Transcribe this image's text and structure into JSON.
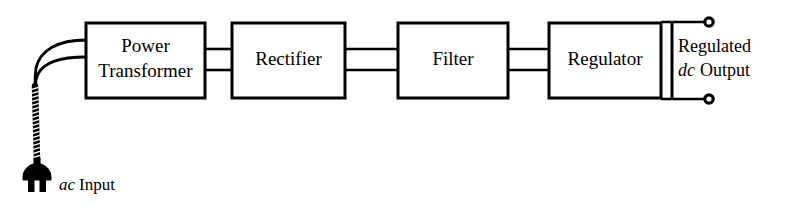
{
  "figure": {
    "type": "block-diagram",
    "background_color": "#ffffff",
    "line_color": "#000000"
  },
  "blocks": [
    {
      "id": "power-transformer",
      "label_line1": "Power",
      "label_line2": "Transformer",
      "x": 86,
      "y": 23,
      "w": 119,
      "h": 75
    },
    {
      "id": "rectifier",
      "label_line1": "Rectifier",
      "label_line2": "",
      "x": 232,
      "y": 23,
      "w": 113,
      "h": 75
    },
    {
      "id": "filter",
      "label_line1": "Filter",
      "label_line2": "",
      "x": 398,
      "y": 23,
      "w": 110,
      "h": 75
    },
    {
      "id": "regulator",
      "label_line1": "Regulator",
      "label_line2": "",
      "x": 549,
      "y": 23,
      "w": 112,
      "h": 75
    }
  ],
  "connections": [
    {
      "from": "power-transformer",
      "to": "rectifier",
      "style": "two-wire"
    },
    {
      "from": "rectifier",
      "to": "filter",
      "style": "two-wire"
    },
    {
      "from": "filter",
      "to": "regulator",
      "style": "two-wire"
    }
  ],
  "input": {
    "connector": "ac-power-plug",
    "cord": "twisted-two-conductor",
    "label_italic": "ac",
    "label_rest": "Input"
  },
  "output": {
    "terminals": 2,
    "terminal_style": "open-circle",
    "label_line1": "Regulated",
    "label_line2_italic": "dc",
    "label_line2_rest": "Output"
  }
}
